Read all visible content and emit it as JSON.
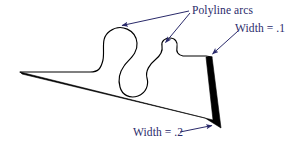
{
  "figure": {
    "title_caption": "",
    "background_color": "#ffffff",
    "stroke_color": "#000000",
    "fill_color": "#000000",
    "annotation_color": "#2a2a6a",
    "labels": [
      {
        "id": "polyline-arcs",
        "text": "Polyline arcs",
        "x": 192,
        "y": 5
      },
      {
        "id": "width-1",
        "text": "Width = .1",
        "x": 235,
        "y": 23
      },
      {
        "id": "width-2",
        "text": "Width = .2",
        "x": 133,
        "y": 127
      }
    ],
    "leader_lines": [
      {
        "id": "arrow-to-large-arc",
        "from_x": 189,
        "from_y": 11,
        "to_x": 119,
        "to_y": 26
      },
      {
        "id": "arrow-to-small-arc",
        "from_x": 190,
        "from_y": 13,
        "to_x": 164,
        "to_y": 44
      },
      {
        "id": "arrow-to-width-1",
        "from_x": 238,
        "from_y": 31,
        "to_x": 211,
        "to_y": 55
      },
      {
        "id": "arrow-to-width-2",
        "from_x": 180,
        "from_y": 132,
        "to_x": 214,
        "to_y": 125
      }
    ],
    "shape": {
      "name": "variable-width-polyline-with-arcs",
      "description": "Closed outline: thin meandering curve with two arc loops on top, tapering solid black band along the bottom and a thick black bar on the right side"
    }
  }
}
